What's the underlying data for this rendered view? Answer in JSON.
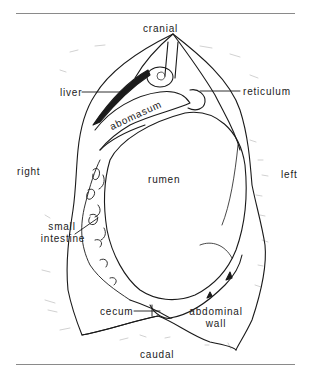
{
  "figure": {
    "orientation": {
      "top": "cranial",
      "bottom": "caudal",
      "left_side": "right",
      "right_side": "left"
    },
    "labels": {
      "liver": "liver",
      "reticulum": "reticulum",
      "abomasum": "abomasum",
      "rumen": "rumen",
      "small_intestine_line1": "small",
      "small_intestine_line2": "intestine",
      "cecum": "cecum",
      "abdominal_wall_line1": "abdominal",
      "abdominal_wall_line2": "wall"
    }
  }
}
